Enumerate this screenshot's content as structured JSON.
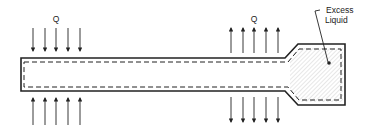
{
  "diagram": {
    "type": "heat-pipe-schematic",
    "labels": {
      "heat_in": "Q",
      "heat_out": "Q",
      "reservoir_line1": "Excess",
      "reservoir_line2": "Liquid"
    },
    "regions": [
      {
        "name": "evaporator",
        "arrows": "inward",
        "arrow_count_top": 5,
        "arrow_count_bottom": 5
      },
      {
        "name": "condenser",
        "arrows": "outward",
        "arrow_count_top": 5,
        "arrow_count_bottom": 5
      },
      {
        "name": "excess-liquid-reservoir",
        "fill": "hatched"
      }
    ],
    "colors": {
      "stroke": "#222222",
      "background": "#ffffff",
      "hatch": "#b8b8b8"
    }
  }
}
